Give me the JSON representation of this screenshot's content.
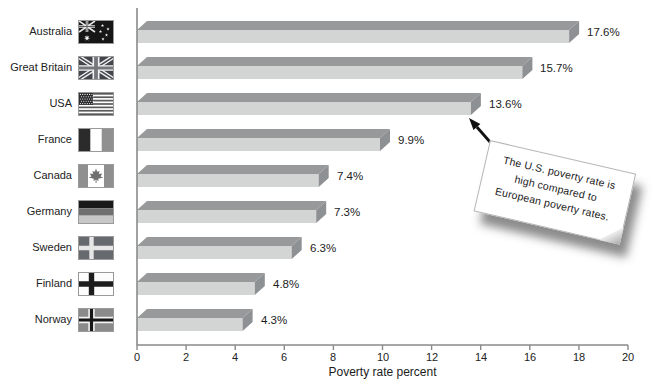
{
  "chart_data": {
    "type": "bar",
    "orientation": "horizontal",
    "xlabel": "Poverty rate percent",
    "xlim": [
      0,
      20
    ],
    "xticks": [
      0,
      2,
      4,
      6,
      8,
      10,
      12,
      14,
      16,
      18,
      20
    ],
    "grid": false,
    "legend": null,
    "categories": [
      "Australia",
      "Great Britain",
      "USA",
      "France",
      "Canada",
      "Germany",
      "Sweden",
      "Finland",
      "Norway"
    ],
    "values": [
      17.6,
      15.7,
      13.6,
      9.9,
      7.4,
      7.3,
      6.3,
      4.8,
      4.3
    ],
    "value_labels": [
      "17.6%",
      "15.7%",
      "13.6%",
      "9.9%",
      "7.4%",
      "7.3%",
      "6.3%",
      "4.8%",
      "4.3%"
    ],
    "flag_icons": [
      "australia-flag-icon",
      "great-britain-flag-icon",
      "usa-flag-icon",
      "france-flag-icon",
      "canada-flag-icon",
      "germany-flag-icon",
      "sweden-flag-icon",
      "finland-flag-icon",
      "norway-flag-icon"
    ],
    "annotation": {
      "text": "The U.S. poverty rate is high compared to European poverty rates.",
      "lines": [
        "The U.S. poverty rate is",
        "high compared to",
        "European poverty rates."
      ],
      "points_to": "USA"
    },
    "colors": {
      "bar_top": "#97999b",
      "bar_front": "#d3d5d4",
      "bar_end": "#8e9193",
      "axis": "#8a8a8a",
      "text": "#222222"
    }
  }
}
